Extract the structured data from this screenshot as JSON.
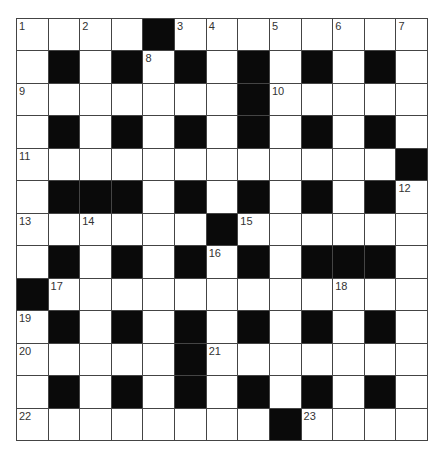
{
  "puzzle": {
    "rows": 13,
    "cols": 13,
    "layout": [
      "....#........",
      ".#.#.#.#.#.#.",
      ".......#.....",
      ".#.#.#.#.#.#.",
      "............#",
      ".###.#.#.#.#.",
      "......#......",
      ".#.#.#.#.###.",
      "#............",
      ".#.#.#.#.#.#.",
      ".....#.......",
      ".#.#.#.#.#.#.",
      "........#...."
    ],
    "numbers": [
      {
        "r": 0,
        "c": 0,
        "n": "1"
      },
      {
        "r": 0,
        "c": 2,
        "n": "2"
      },
      {
        "r": 0,
        "c": 5,
        "n": "3"
      },
      {
        "r": 0,
        "c": 6,
        "n": "4"
      },
      {
        "r": 0,
        "c": 8,
        "n": "5"
      },
      {
        "r": 0,
        "c": 10,
        "n": "6"
      },
      {
        "r": 0,
        "c": 12,
        "n": "7"
      },
      {
        "r": 1,
        "c": 4,
        "n": "8"
      },
      {
        "r": 2,
        "c": 0,
        "n": "9"
      },
      {
        "r": 2,
        "c": 8,
        "n": "10"
      },
      {
        "r": 4,
        "c": 0,
        "n": "11"
      },
      {
        "r": 5,
        "c": 12,
        "n": "12"
      },
      {
        "r": 6,
        "c": 0,
        "n": "13"
      },
      {
        "r": 6,
        "c": 2,
        "n": "14"
      },
      {
        "r": 6,
        "c": 7,
        "n": "15"
      },
      {
        "r": 7,
        "c": 6,
        "n": "16"
      },
      {
        "r": 8,
        "c": 1,
        "n": "17"
      },
      {
        "r": 8,
        "c": 10,
        "n": "18"
      },
      {
        "r": 9,
        "c": 0,
        "n": "19"
      },
      {
        "r": 10,
        "c": 0,
        "n": "20"
      },
      {
        "r": 10,
        "c": 6,
        "n": "21"
      },
      {
        "r": 12,
        "c": 0,
        "n": "22"
      },
      {
        "r": 12,
        "c": 9,
        "n": "23"
      }
    ]
  },
  "colors": {
    "block": "#0a0a0a",
    "cell": "#ffffff",
    "gridline": "#444444",
    "number_text": "#333333"
  }
}
